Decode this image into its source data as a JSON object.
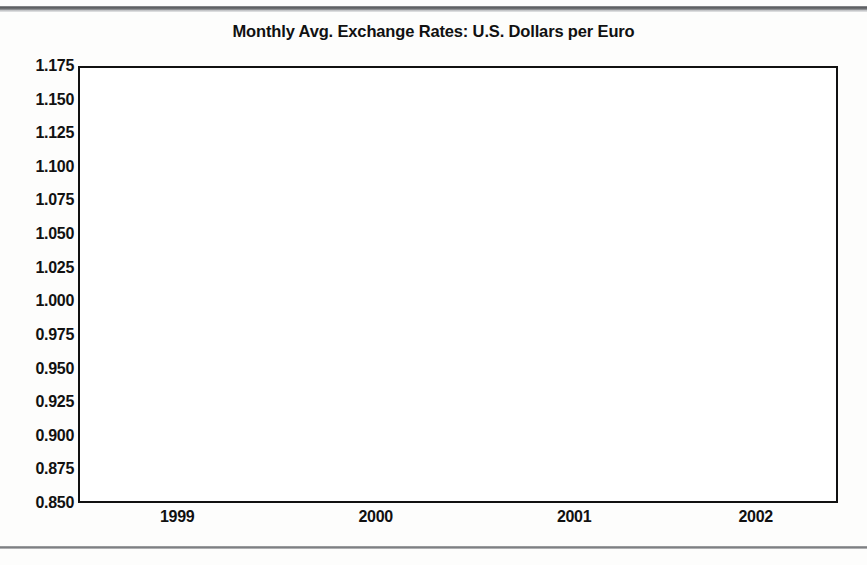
{
  "page": {
    "has_top_rule": true,
    "has_bottom_rule": true
  },
  "chart_data": {
    "type": "line",
    "title": "Monthly Avg. Exchange Rates: U.S. Dollars per Euro",
    "xlabel": "",
    "ylabel": "",
    "ylim": [
      0.85,
      1.175
    ],
    "ytick_step": 0.025,
    "ytick_labels": [
      "1.175",
      "1.150",
      "1.125",
      "1.100",
      "1.075",
      "1.050",
      "1.025",
      "1.000",
      "0.975",
      "0.950",
      "0.925",
      "0.900",
      "0.875",
      "0.850"
    ],
    "ytick_values": [
      1.175,
      1.15,
      1.125,
      1.1,
      1.075,
      1.05,
      1.025,
      1.0,
      0.975,
      0.95,
      0.925,
      0.9,
      0.875,
      0.85
    ],
    "xtick_labels": [
      "1999",
      "2000",
      "2001",
      "2002"
    ],
    "xtick_boundaries": [
      2000,
      2001,
      2002,
      2003
    ],
    "xlim": [
      1999.0,
      2002.83
    ],
    "grid": true,
    "legend": "none",
    "line_color": "#3a3a3a",
    "line_width": 3.2,
    "series": [
      {
        "name": "U.S. Dollars per Euro",
        "x": [
          "1999-01",
          "1999-02",
          "1999-03",
          "1999-04",
          "1999-05",
          "1999-06",
          "1999-07",
          "1999-08",
          "1999-09",
          "1999-10",
          "1999-11",
          "1999-12",
          "2000-01",
          "2000-02",
          "2000-03",
          "2000-04",
          "2000-05",
          "2000-06",
          "2000-07",
          "2000-08",
          "2000-09",
          "2000-10",
          "2000-11",
          "2000-12",
          "2001-01",
          "2001-02",
          "2001-03",
          "2001-04",
          "2001-05",
          "2001-06",
          "2001-07",
          "2001-08",
          "2001-09",
          "2001-10",
          "2001-11",
          "2001-12",
          "2002-01",
          "2002-02",
          "2002-03",
          "2002-04",
          "2002-05",
          "2002-06",
          "2002-07",
          "2002-08",
          "2002-09",
          "2002-10"
        ],
        "values": [
          1.16,
          1.121,
          1.088,
          1.067,
          1.063,
          1.035,
          1.042,
          1.06,
          1.05,
          1.067,
          1.034,
          1.011,
          1.007,
          0.984,
          0.964,
          0.947,
          0.906,
          0.949,
          0.94,
          0.904,
          0.872,
          0.855,
          0.85,
          0.897,
          0.93,
          0.921,
          0.909,
          0.893,
          0.874,
          0.853,
          0.861,
          0.877,
          0.909,
          0.899,
          0.888,
          0.89,
          0.883,
          0.871,
          0.867,
          0.886,
          0.917,
          0.956,
          0.992,
          0.978,
          0.981,
          1.073
        ]
      }
    ]
  }
}
